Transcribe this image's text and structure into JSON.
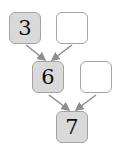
{
  "diagram": {
    "nodes": [
      {
        "id": "a",
        "value": "3",
        "filled": true
      },
      {
        "id": "b",
        "value": "",
        "filled": false
      },
      {
        "id": "c",
        "value": "6",
        "filled": true
      },
      {
        "id": "d",
        "value": "",
        "filled": false
      },
      {
        "id": "e",
        "value": "7",
        "filled": true
      }
    ],
    "edges": [
      [
        "a",
        "c"
      ],
      [
        "b",
        "c"
      ],
      [
        "c",
        "e"
      ],
      [
        "d",
        "e"
      ]
    ],
    "colors": {
      "filled": "#d9d9d9",
      "border": "#a3a3a3",
      "arrow": "#8c8c8c"
    }
  }
}
